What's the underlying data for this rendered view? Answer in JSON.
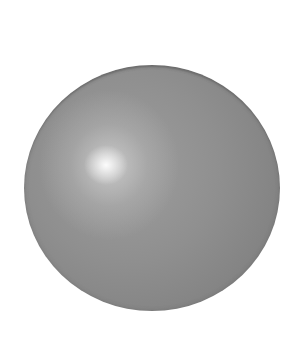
{
  "image": {
    "subject": "gray glossy sphere",
    "background_color": "#ffffff",
    "sphere": {
      "base_color": "#8c8c8c",
      "edge_color": "#7a7a7a",
      "highlight_color": "#f2f2f2"
    }
  }
}
